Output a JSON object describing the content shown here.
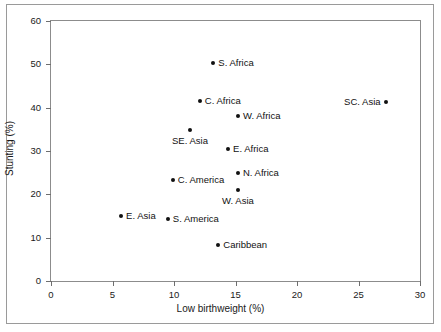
{
  "chart_data": {
    "type": "scatter",
    "title": "",
    "xlabel": "Low birthweight (%)",
    "ylabel": "Stunting (%)",
    "xlim": [
      0,
      30
    ],
    "ylim": [
      0,
      60
    ],
    "xticks": [
      0,
      5,
      10,
      15,
      20,
      25,
      30
    ],
    "yticks": [
      0,
      10,
      20,
      30,
      40,
      50,
      60
    ],
    "xticklabels": [
      "0",
      "5",
      "10",
      "15",
      "20",
      "25",
      "30"
    ],
    "yticklabels": [
      "0",
      "10",
      "20",
      "30",
      "40",
      "50",
      "60"
    ],
    "grid": false,
    "legend": false,
    "marker_color": "#111111",
    "points": [
      {
        "label": "S. Africa",
        "x": 13.2,
        "y": 50.3,
        "label_pos": "right"
      },
      {
        "label": "C. Africa",
        "x": 12.1,
        "y": 41.6,
        "label_pos": "right"
      },
      {
        "label": "SC. Asia",
        "x": 27.2,
        "y": 41.2,
        "label_pos": "left"
      },
      {
        "label": "W. Africa",
        "x": 15.2,
        "y": 38.0,
        "label_pos": "right"
      },
      {
        "label": "SE. Asia",
        "x": 11.3,
        "y": 34.8,
        "label_pos": "below"
      },
      {
        "label": "E. Africa",
        "x": 14.4,
        "y": 30.4,
        "label_pos": "right"
      },
      {
        "label": "N. Africa",
        "x": 15.2,
        "y": 25.0,
        "label_pos": "right"
      },
      {
        "label": "C. America",
        "x": 9.9,
        "y": 23.3,
        "label_pos": "right"
      },
      {
        "label": "W. Asia",
        "x": 15.2,
        "y": 21.0,
        "label_pos": "below"
      },
      {
        "label": "E. Asia",
        "x": 5.7,
        "y": 14.9,
        "label_pos": "right"
      },
      {
        "label": "S. America",
        "x": 9.5,
        "y": 14.2,
        "label_pos": "right"
      },
      {
        "label": "Caribbean",
        "x": 13.6,
        "y": 8.2,
        "label_pos": "right"
      }
    ]
  }
}
